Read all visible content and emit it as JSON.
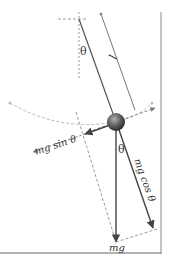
{
  "diagram": {
    "labels": {
      "theta_top": "θ",
      "length": "l",
      "theta_bottom": "θ",
      "mg_sin": "mg sin θ",
      "mg_cos": "mg cos θ",
      "mg": "mg"
    },
    "colors": {
      "line": "#555555",
      "dashed": "#9a9a9a",
      "arc": "#b5b5b5",
      "ball_light": "#9a9a9a",
      "ball_dark": "#2e2e2e",
      "text": "#333333"
    }
  }
}
